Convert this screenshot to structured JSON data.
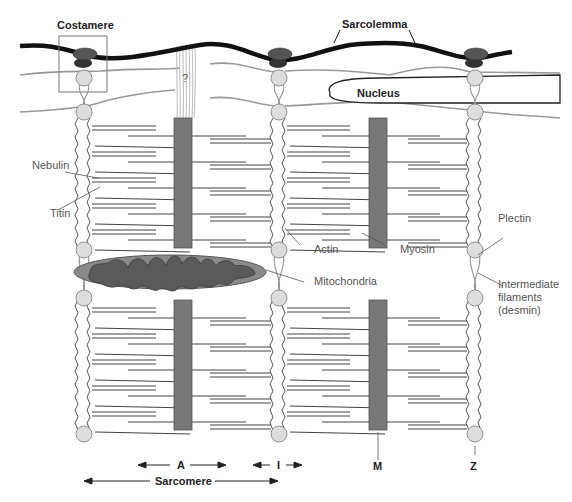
{
  "labels": {
    "costamere": "Costamere",
    "sarcolemma": "Sarcolemma",
    "nucleus": "Nucleus",
    "nebulin": "Nebulin",
    "titin": "Titin",
    "actin": "Actin",
    "myosin": "Myosin",
    "mitochondria": "Mitochondria",
    "plectin": "Plectin",
    "intermediate_filaments_1": "Intermediate",
    "intermediate_filaments_2": "filaments",
    "intermediate_filaments_3": "(desmin)",
    "unknown": "?",
    "band_a": "A",
    "band_i": "I",
    "line_m": "M",
    "line_z": "Z",
    "sarcomere": "Sarcomere"
  },
  "colors": {
    "sarcolemma": "#111111",
    "costamere_cap": "#555555",
    "costamere_base": "#333333",
    "z_disk_ball": "#dddddd",
    "filament": "#444444",
    "myosin_band": "#777777",
    "mitochondria_outer": "#888888",
    "mitochondria_inner": "#555555",
    "intermediate_filament": "#999999",
    "label_text": "#555555"
  }
}
